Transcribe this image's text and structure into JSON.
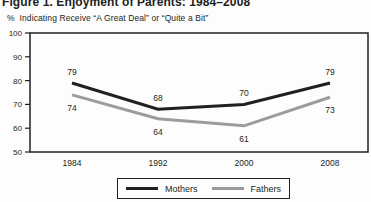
{
  "figure": {
    "title": "Figure 1. Enjoyment of Parents: 1984–2008",
    "subtitle": "%  Indicating Receive “A Great Deal” or “Quite a Bit”"
  },
  "chart_data": {
    "type": "line",
    "title": "Figure 1. Enjoyment of Parents: 1984–2008",
    "axis_note": "% Indicating Receive “A Great Deal” or “Quite a Bit”",
    "categories": [
      "1984",
      "1992",
      "2000",
      "2008"
    ],
    "series": [
      {
        "name": "Mothers",
        "values": [
          79,
          68,
          70,
          79
        ],
        "color": "#231f20"
      },
      {
        "name": "Fathers",
        "values": [
          74,
          64,
          61,
          73
        ],
        "color": "#9c9c9c"
      }
    ],
    "ylim": [
      50,
      100
    ],
    "yticks": [
      100,
      90,
      80,
      70,
      60,
      50
    ],
    "grid": false,
    "data_labels_shown": true,
    "legend_position": "bottom",
    "plot_border": true
  }
}
